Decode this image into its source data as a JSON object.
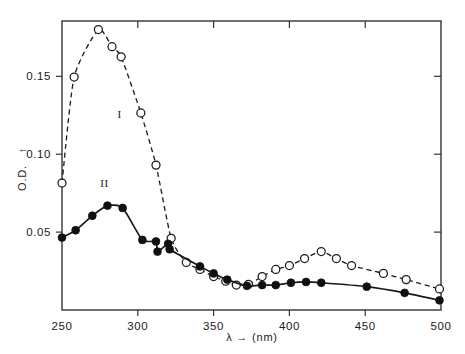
{
  "chart_data": {
    "type": "line",
    "title": "",
    "subtitle": "",
    "xlabel": "λ → (nm)",
    "ylabel": "O.D. ↑",
    "xlim": [
      250,
      500
    ],
    "ylim": [
      0,
      0.1855
    ],
    "grid": false,
    "legend_position": "inline-annotations",
    "xticks": [
      250,
      300,
      350,
      400,
      450,
      500
    ],
    "xtick_labels": [
      "250",
      "300",
      "350",
      "400",
      "450",
      "500"
    ],
    "yticks": [
      0.05,
      0.1,
      0.15
    ],
    "ytick_labels": [
      "0.05",
      "0.10",
      "0.15"
    ],
    "top_axis_ticks": [
      300,
      350,
      400,
      450
    ],
    "annotations": [
      {
        "text": "I",
        "x": 288,
        "y": 0.123,
        "series": "I"
      },
      {
        "text": "II",
        "x": 278,
        "y": 0.079,
        "series": "II"
      }
    ],
    "series": [
      {
        "name": "I",
        "label": "I",
        "marker": "open-circle",
        "line_style": "dashed",
        "color": "#1a1a1a",
        "points": [
          {
            "x": 250,
            "y": 0.0815
          },
          {
            "x": 258,
            "y": 0.1495
          },
          {
            "x": 274,
            "y": 0.18
          },
          {
            "x": 283,
            "y": 0.169
          },
          {
            "x": 289,
            "y": 0.1625
          },
          {
            "x": 302,
            "y": 0.1265
          },
          {
            "x": 312,
            "y": 0.093
          },
          {
            "x": 322,
            "y": 0.046
          },
          {
            "x": 332,
            "y": 0.0305
          },
          {
            "x": 341,
            "y": 0.026
          },
          {
            "x": 350,
            "y": 0.0215
          },
          {
            "x": 358,
            "y": 0.0185
          },
          {
            "x": 365,
            "y": 0.016
          },
          {
            "x": 373,
            "y": 0.0165
          },
          {
            "x": 382,
            "y": 0.0215
          },
          {
            "x": 391,
            "y": 0.026
          },
          {
            "x": 400,
            "y": 0.0285
          },
          {
            "x": 410,
            "y": 0.033
          },
          {
            "x": 421,
            "y": 0.0375
          },
          {
            "x": 431,
            "y": 0.033
          },
          {
            "x": 441,
            "y": 0.0285
          },
          {
            "x": 462,
            "y": 0.0235
          },
          {
            "x": 477,
            "y": 0.0195
          },
          {
            "x": 499,
            "y": 0.0135
          }
        ]
      },
      {
        "name": "II",
        "label": "II",
        "marker": "filled-circle",
        "line_style": "solid",
        "color": "#101010",
        "points": [
          {
            "x": 250,
            "y": 0.0465
          },
          {
            "x": 259,
            "y": 0.0512
          },
          {
            "x": 270,
            "y": 0.0605
          },
          {
            "x": 280,
            "y": 0.067
          },
          {
            "x": 290,
            "y": 0.0655
          },
          {
            "x": 303,
            "y": 0.045
          },
          {
            "x": 312,
            "y": 0.044
          },
          {
            "x": 313,
            "y": 0.0375
          },
          {
            "x": 320,
            "y": 0.0425
          },
          {
            "x": 321,
            "y": 0.039
          },
          {
            "x": 341,
            "y": 0.028
          },
          {
            "x": 350,
            "y": 0.0235
          },
          {
            "x": 359,
            "y": 0.0195
          },
          {
            "x": 372,
            "y": 0.0155
          },
          {
            "x": 382,
            "y": 0.016
          },
          {
            "x": 391,
            "y": 0.016
          },
          {
            "x": 401,
            "y": 0.0175
          },
          {
            "x": 411,
            "y": 0.018
          },
          {
            "x": 421,
            "y": 0.0175
          },
          {
            "x": 451,
            "y": 0.015
          },
          {
            "x": 476,
            "y": 0.011
          },
          {
            "x": 499,
            "y": 0.0062
          }
        ]
      }
    ]
  },
  "axes": {
    "y_axis_caption": "O.D.",
    "y_axis_arrow": "↑",
    "x_axis_symbol": "λ",
    "x_axis_arrow": "→",
    "x_axis_unit": "(nm)"
  }
}
